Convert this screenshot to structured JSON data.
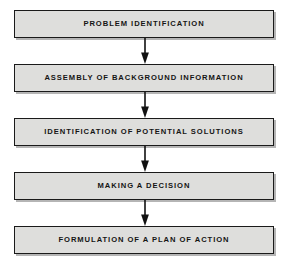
{
  "diagram": {
    "orientation": "vertical-top-to-bottom",
    "colors": {
      "background": "#ffffff",
      "node_fill": "#dededc",
      "node_border": "#1a1a1a",
      "text": "#151515",
      "arrow": "#111111"
    },
    "nodes": [
      {
        "id": "node-1",
        "label": "PROBLEM IDENTIFICATION"
      },
      {
        "id": "node-2",
        "label": "ASSEMBLY OF BACKGROUND INFORMATION"
      },
      {
        "id": "node-3",
        "label": "IDENTIFICATION OF POTENTIAL SOLUTIONS"
      },
      {
        "id": "node-4",
        "label": "MAKING A DECISION"
      },
      {
        "id": "node-5",
        "label": "FORMULATION OF A PLAN OF ACTION"
      }
    ],
    "connectors": [
      {
        "id": "connector-1",
        "icon": "down-arrow-icon",
        "from": "node-1",
        "to": "node-2"
      },
      {
        "id": "connector-2",
        "icon": "down-arrow-icon",
        "from": "node-2",
        "to": "node-3"
      },
      {
        "id": "connector-3",
        "icon": "down-arrow-icon",
        "from": "node-3",
        "to": "node-4"
      },
      {
        "id": "connector-4",
        "icon": "down-arrow-icon",
        "from": "node-4",
        "to": "node-5"
      }
    ]
  }
}
